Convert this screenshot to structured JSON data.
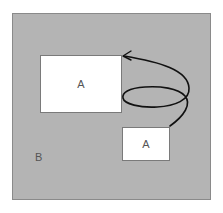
{
  "diagram": {
    "outer_region": {
      "label": "B",
      "fill": "#b4b4b4"
    },
    "boxes": [
      {
        "id": "large",
        "label": "A",
        "fill": "#ffffff"
      },
      {
        "id": "small",
        "label": "A",
        "fill": "#ffffff"
      }
    ],
    "arrow": {
      "from": "small",
      "to": "large",
      "style": "looped curve",
      "color": "#111111"
    }
  }
}
